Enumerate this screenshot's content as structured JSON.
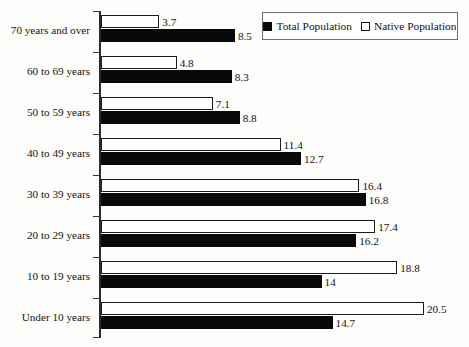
{
  "chart_data": {
    "type": "bar",
    "orientation": "horizontal",
    "title": "",
    "xlabel": "",
    "ylabel": "",
    "grid": false,
    "xlim": [
      0,
      21
    ],
    "legend_position": "top-right",
    "categories": [
      "70 years and over",
      "60 to 69 years",
      "50 to 59 years",
      "40 to 49 years",
      "30 to 39 years",
      "20 to 29 years",
      "10 to 19 years",
      "Under 10 years"
    ],
    "series": [
      {
        "name": "Total Population",
        "style": "filled-black",
        "values": [
          8.5,
          8.3,
          8.8,
          12.7,
          16.8,
          16.2,
          14,
          14.7
        ],
        "labels": [
          "8.5",
          "8.3",
          "8.8",
          "12.7",
          "16.8",
          "16.2",
          "14",
          "14.7"
        ]
      },
      {
        "name": "Native Population",
        "style": "hollow-white",
        "values": [
          3.7,
          4.8,
          7.1,
          11.4,
          16.4,
          17.4,
          18.8,
          20.5
        ],
        "labels": [
          "3.7",
          "4.8",
          "7.1",
          "11.4",
          "16.4",
          "17.4",
          "18.8",
          "20.5"
        ]
      }
    ]
  },
  "legend": {
    "entries": [
      {
        "label": "Total Population",
        "swatch": "filled-square-icon"
      },
      {
        "label": "Native Population",
        "swatch": "hollow-square-icon"
      }
    ]
  },
  "colors": {
    "total_population": "#090909",
    "native_population": "#ffffff",
    "native_population_border": "#1c1c1c",
    "axis": "#2a2a2a",
    "text": "#121212",
    "background": "#fdfdfb"
  }
}
